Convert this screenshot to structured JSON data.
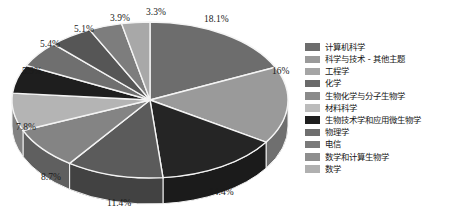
{
  "chart_data": {
    "type": "pie",
    "title": "",
    "subtitle": "",
    "xlabel": "",
    "ylabel": "",
    "legend_position": "right",
    "grid": false,
    "three_d": true,
    "value_unit": "percent",
    "categories": [
      "计算机科学",
      "科学与技术 - 其他主题",
      "工程学",
      "化学",
      "生物化学与分子生物学",
      "材料科学",
      "生物技术学和应用微生物学",
      "物理学",
      "电信",
      "数学和计算生物学",
      "数学"
    ],
    "values": [
      18.1,
      16,
      14.4,
      11.4,
      8.7,
      7.8,
      5.9,
      5.4,
      5.1,
      3.9,
      3.3
    ],
    "data_labels": [
      "18.1%",
      "16%",
      "14.4%",
      "11.4%",
      "8.7%",
      "7.8%",
      "5.9%",
      "5.4%",
      "5.1%",
      "3.9%",
      "3.3%"
    ],
    "colors": [
      "#6d6d6d",
      "#9a9a9a",
      "#252525",
      "#5b5b5b",
      "#848484",
      "#b4b4b4",
      "#1e1e1e",
      "#6f6f6f",
      "#565656",
      "#7d7d7d",
      "#a8a8a8"
    ],
    "series": [
      {
        "name": "学科领域占比",
        "values": [
          18.1,
          16,
          14.4,
          11.4,
          8.7,
          7.8,
          5.9,
          5.4,
          5.1,
          3.9,
          3.3
        ]
      }
    ]
  },
  "legend": {
    "items": [
      {
        "label": "计算机科学",
        "color": "#6d6d6d"
      },
      {
        "label": "科学与技术 - 其他主题",
        "color": "#9a9a9a"
      },
      {
        "label": "工程学",
        "color": "#a5a5a5"
      },
      {
        "label": "化学",
        "color": "#6a6a6a"
      },
      {
        "label": "生物化学与分子生物学",
        "color": "#8a8a8a"
      },
      {
        "label": "材料科学",
        "color": "#bcbcbc"
      },
      {
        "label": "生物技术学和应用微生物学",
        "color": "#1e1e1e"
      },
      {
        "label": "物理学",
        "color": "#6f6f6f"
      },
      {
        "label": "电信",
        "color": "#7a7a7a"
      },
      {
        "label": "数学和计算生物学",
        "color": "#8e8e8e"
      },
      {
        "label": "数学",
        "color": "#b0b0b0"
      }
    ]
  },
  "labels": {
    "pct_0": "18.1%",
    "pct_1": "16%",
    "pct_2": "14.4%",
    "pct_3": "11.4%",
    "pct_4": "8.7%",
    "pct_5": "7.8%",
    "pct_6": "5.9%",
    "pct_7": "5.4%",
    "pct_8": "5.1%",
    "pct_9": "3.9%",
    "pct_10": "3.3%"
  }
}
